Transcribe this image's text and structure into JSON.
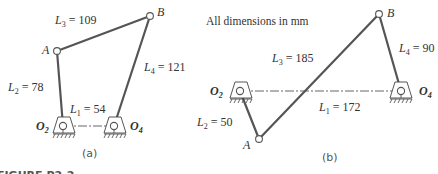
{
  "figure": {
    "caption_partial": "FIGURE P2-2",
    "note": "All dimensions in mm",
    "panels": [
      {
        "id": "a",
        "label": "(a)",
        "links": [
          {
            "name": "L1",
            "sub": "1",
            "text": " = 54",
            "value": 54
          },
          {
            "name": "L2",
            "sub": "2",
            "text": " = 78",
            "value": 78
          },
          {
            "name": "L3",
            "sub": "3",
            "text": " = 109",
            "value": 109
          },
          {
            "name": "L4",
            "sub": "4",
            "text": " = 121",
            "value": 121
          }
        ],
        "joints": {
          "A": "A",
          "B": "B",
          "O2": "O",
          "O2_sub": "2",
          "O4": "O",
          "O4_sub": "4"
        }
      },
      {
        "id": "b",
        "label": "(b)",
        "links": [
          {
            "name": "L1",
            "sub": "1",
            "text": " = 172",
            "value": 172
          },
          {
            "name": "L2",
            "sub": "2",
            "text": " = 50",
            "value": 50
          },
          {
            "name": "L3",
            "sub": "3",
            "text": " = 185",
            "value": 185
          },
          {
            "name": "L4",
            "sub": "4",
            "text": " = 90",
            "value": 90
          }
        ],
        "joints": {
          "A": "A",
          "B": "B",
          "O2": "O",
          "O2_sub": "2",
          "O4": "O",
          "O4_sub": "4"
        }
      }
    ],
    "colors": {
      "link": "#555555",
      "text": "#333333",
      "background": "#ffffff"
    }
  }
}
